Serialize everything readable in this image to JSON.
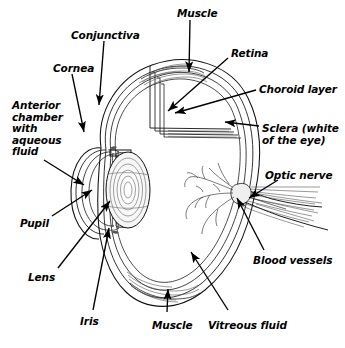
{
  "diagram": {
    "background_color": "#ffffff",
    "ink_color": "#000000",
    "labels": [
      {
        "id": "muscle-top",
        "text": "Muscle",
        "x": 177,
        "y": 8
      },
      {
        "id": "conjunctiva",
        "text": "Conjunctiva",
        "x": 71,
        "y": 30
      },
      {
        "id": "retina",
        "text": "Retina",
        "x": 231,
        "y": 48
      },
      {
        "id": "cornea",
        "text": "Cornea",
        "x": 53,
        "y": 63
      },
      {
        "id": "choroid-layer",
        "text": "Choroid layer",
        "x": 259,
        "y": 84
      },
      {
        "id": "anterior-chamber",
        "text": "Anterior\nchamber\nwith\naqueous\nfluid",
        "x": 12,
        "y": 100
      },
      {
        "id": "sclera",
        "text": "Sclera (white\nof the eye)",
        "x": 262,
        "y": 123
      },
      {
        "id": "optic-nerve",
        "text": "Optic nerve",
        "x": 265,
        "y": 170
      },
      {
        "id": "pupil",
        "text": "Pupil",
        "x": 20,
        "y": 218
      },
      {
        "id": "blood-vessels",
        "text": "Blood vessels",
        "x": 253,
        "y": 255
      },
      {
        "id": "lens",
        "text": "Lens",
        "x": 28,
        "y": 272
      },
      {
        "id": "iris",
        "text": "Iris",
        "x": 80,
        "y": 316
      },
      {
        "id": "muscle-bottom",
        "text": "Muscle",
        "x": 152,
        "y": 320
      },
      {
        "id": "vitreous-fluid",
        "text": "Vitreous fluid",
        "x": 208,
        "y": 320
      }
    ],
    "structures": [
      "sclera",
      "choroid-layer",
      "retina",
      "cornea",
      "conjunctiva",
      "anterior-chamber",
      "lens",
      "iris",
      "pupil",
      "vitreous-fluid",
      "optic-nerve",
      "blood-vessels",
      "muscle-top",
      "muscle-bottom"
    ]
  }
}
